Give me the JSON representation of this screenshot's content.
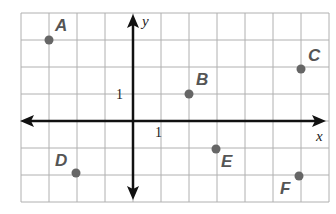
{
  "axes": {
    "x_label": "x",
    "y_label": "y",
    "x_tick": "1",
    "y_tick": "1"
  },
  "grid": {
    "x_min": -4,
    "x_max": 7,
    "y_min": -3,
    "y_max": 4,
    "color": "#aaaaaa"
  },
  "points": [
    {
      "label": "A",
      "x": -3,
      "y": 3
    },
    {
      "label": "B",
      "x": 2,
      "y": 1
    },
    {
      "label": "C",
      "x": 6,
      "y": 2
    },
    {
      "label": "D",
      "x": -2,
      "y": -2
    },
    {
      "label": "E",
      "x": 3,
      "y": -1
    },
    {
      "label": "F",
      "x": 6,
      "y": -2
    }
  ],
  "colors": {
    "point": "#666666",
    "axis": "#111111",
    "label": "#555555"
  }
}
